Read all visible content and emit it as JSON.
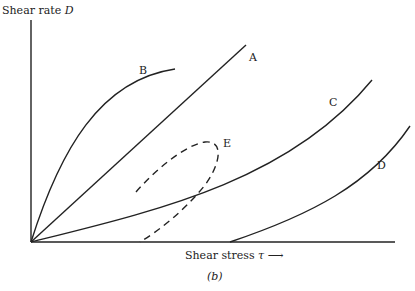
{
  "axes": {
    "y_label": "Shear rate ",
    "y_symbol": "D",
    "x_label": "Shear stress ",
    "x_symbol": "τ",
    "x_arrow": "⟶"
  },
  "caption": "(b)",
  "curves": [
    {
      "id": "A",
      "label": "A",
      "style": "solid",
      "shape": "straight line through origin"
    },
    {
      "id": "B",
      "label": "B",
      "style": "solid",
      "shape": "concave-down curve through origin"
    },
    {
      "id": "C",
      "label": "C",
      "style": "solid",
      "shape": "concave-up curve through origin"
    },
    {
      "id": "D",
      "label": "D",
      "style": "solid",
      "shape": "concave-up curve with yield offset"
    },
    {
      "id": "E",
      "label": "E",
      "style": "dashed",
      "shape": "hysteresis loop with yield offset"
    }
  ]
}
